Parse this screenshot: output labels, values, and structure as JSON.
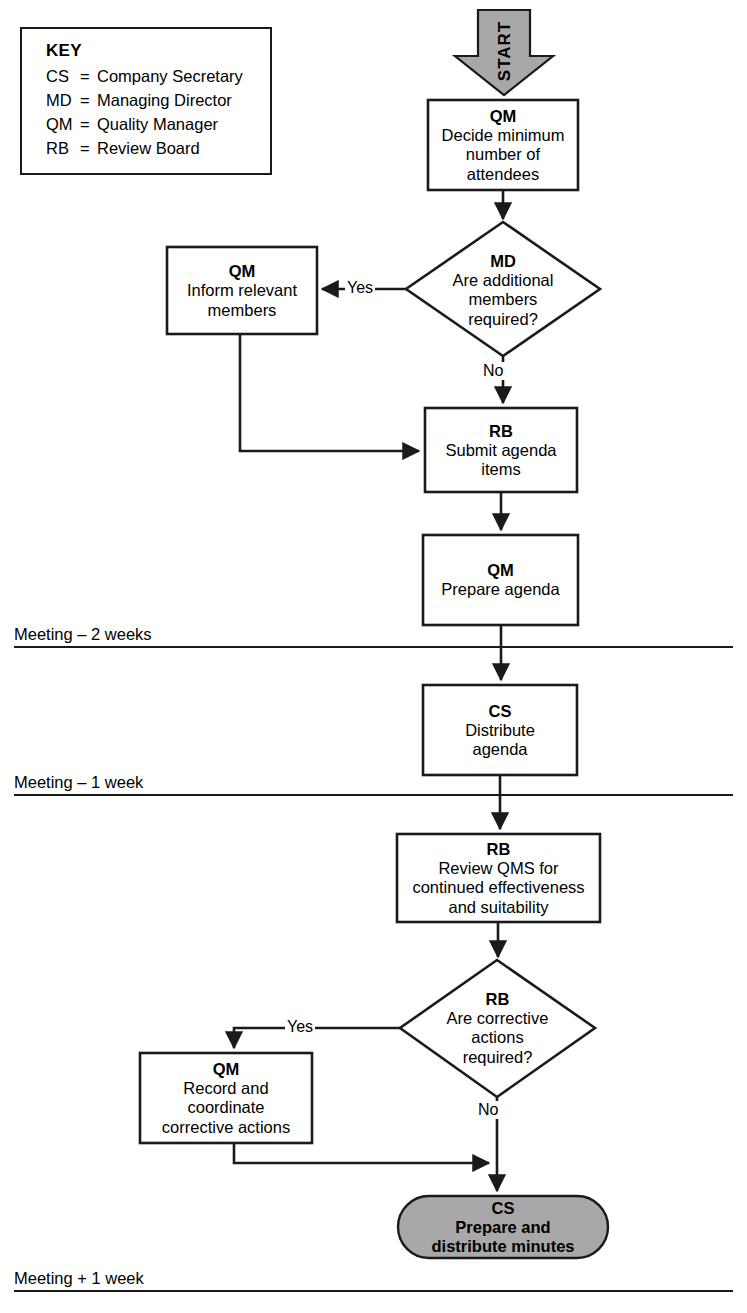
{
  "legend": {
    "title": "KEY",
    "entries": [
      {
        "abbr": "CS",
        "eq": "=",
        "meaning": "Company Secretary"
      },
      {
        "abbr": "MD",
        "eq": "=",
        "meaning": "Managing Director"
      },
      {
        "abbr": "QM",
        "eq": "=",
        "meaning": "Quality Manager"
      },
      {
        "abbr": "RB",
        "eq": "=",
        "meaning": "Review Board"
      }
    ]
  },
  "start": {
    "label": "START"
  },
  "nodes": {
    "decide_attendees": {
      "role": "QM",
      "text": "Decide minimum\nnumber of\nattendees",
      "shape": "process"
    },
    "additional_members": {
      "role": "MD",
      "text": "Are additional\nmembers\nrequired?",
      "shape": "decision"
    },
    "inform_members": {
      "role": "QM",
      "text": "Inform relevant\nmembers",
      "shape": "process"
    },
    "submit_agenda": {
      "role": "RB",
      "text": "Submit agenda\nitems",
      "shape": "process"
    },
    "prepare_agenda": {
      "role": "QM",
      "text": "Prepare agenda",
      "shape": "process"
    },
    "distribute_agenda": {
      "role": "CS",
      "text": "Distribute\nagenda",
      "shape": "process"
    },
    "review_qms": {
      "role": "RB",
      "text": "Review QMS for\ncontinued effectiveness\nand suitability",
      "shape": "process"
    },
    "corrective_actions": {
      "role": "RB",
      "text": "Are corrective\nactions\nrequired?",
      "shape": "decision"
    },
    "record_corrective": {
      "role": "QM",
      "text": "Record and\ncoordinate\ncorrective actions",
      "shape": "process"
    },
    "prepare_minutes": {
      "role": "CS",
      "text": "Prepare and\ndistribute minutes",
      "shape": "terminator"
    }
  },
  "edge_labels": {
    "members_yes": "Yes",
    "members_no": "No",
    "corrective_yes": "Yes",
    "corrective_no": "No"
  },
  "milestones": [
    {
      "id": "minus-2-weeks",
      "label": "Meeting – 2 weeks"
    },
    {
      "id": "minus-1-week",
      "label": "Meeting – 1 week"
    },
    {
      "id": "plus-1-week",
      "label": "Meeting + 1 week"
    }
  ],
  "colors": {
    "stroke": "#1a1a1a",
    "fill": "#ffffff",
    "shaded_fill": "#a8a8a8",
    "text": "#000000"
  }
}
